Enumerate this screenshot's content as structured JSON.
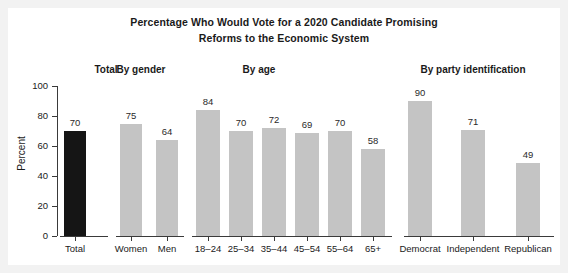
{
  "title": {
    "line1": "Percentage Who Would Vote for a 2020 Candidate Promising",
    "line2": "Reforms to the Economic System"
  },
  "chart_data": {
    "type": "bar",
    "title": "Percentage Who Would Vote for a 2020 Candidate Promising Reforms to the Economic System",
    "xlabel": "",
    "ylabel": "Percent",
    "ylim": [
      0,
      100
    ],
    "yticks": [
      0,
      20,
      40,
      60,
      80,
      100
    ],
    "grid": false,
    "legend": null,
    "groups": [
      {
        "header": "Total",
        "categories": [
          "Total"
        ],
        "values": [
          70
        ],
        "colors": [
          "#151515"
        ]
      },
      {
        "header": "By gender",
        "categories": [
          "Women",
          "Men"
        ],
        "values": [
          75,
          64
        ],
        "colors": [
          "#c4c4c4",
          "#c4c4c4"
        ]
      },
      {
        "header": "By age",
        "categories": [
          "18–24",
          "25–34",
          "35–44",
          "45–54",
          "55–64",
          "65+"
        ],
        "values": [
          84,
          70,
          72,
          69,
          70,
          58
        ],
        "colors": [
          "#c4c4c4",
          "#c4c4c4",
          "#c4c4c4",
          "#c4c4c4",
          "#c4c4c4",
          "#c4c4c4"
        ]
      },
      {
        "header": "By party identification",
        "categories": [
          "Democrat",
          "Independent",
          "Republican"
        ],
        "values": [
          90,
          71,
          49
        ],
        "colors": [
          "#c4c4c4",
          "#c4c4c4",
          "#c4c4c4"
        ]
      }
    ],
    "categories": [
      "Total",
      "Women",
      "Men",
      "18–24",
      "25–34",
      "35–44",
      "45–54",
      "55–64",
      "65+",
      "Democrat",
      "Independent",
      "Republican"
    ],
    "values": [
      70,
      75,
      64,
      84,
      70,
      72,
      69,
      70,
      58,
      90,
      71,
      49
    ]
  },
  "colors": {
    "bar_gray": "#c4c4c4",
    "bar_dark": "#151515",
    "axis": "#3a3a3a",
    "text": "#1a1a1a",
    "panel": "#ffffff",
    "page": "#f2f2f2"
  },
  "yticks": [
    {
      "label": "100",
      "value": 100
    },
    {
      "label": "80",
      "value": 80
    },
    {
      "label": "60",
      "value": 60
    },
    {
      "label": "40",
      "value": 40
    },
    {
      "label": "20",
      "value": 20
    },
    {
      "label": "0",
      "value": 0
    }
  ],
  "layout": {
    "plot_top": 78,
    "plot_bottom": 228,
    "groups": [
      {
        "header_x": 63,
        "header_w": 70,
        "axis_x": 52,
        "axis_w": 48,
        "bars": [
          {
            "x": 56,
            "w": 22
          }
        ]
      },
      {
        "header_x": 88,
        "header_w": 90,
        "axis_x": 108,
        "axis_w": 68,
        "bars": [
          {
            "x": 112,
            "w": 22
          },
          {
            "x": 148,
            "w": 22
          }
        ]
      },
      {
        "header_x": 206,
        "header_w": 90,
        "axis_x": 184,
        "axis_w": 200,
        "bars": [
          {
            "x": 188,
            "w": 24
          },
          {
            "x": 221,
            "w": 24
          },
          {
            "x": 254,
            "w": 24
          },
          {
            "x": 287,
            "w": 24
          },
          {
            "x": 320,
            "w": 24
          },
          {
            "x": 353,
            "w": 24
          }
        ]
      },
      {
        "header_x": 385,
        "header_w": 160,
        "axis_x": 396,
        "axis_w": 150,
        "bars": [
          {
            "x": 400,
            "w": 24
          },
          {
            "x": 453,
            "w": 24
          },
          {
            "x": 508,
            "w": 24
          }
        ]
      }
    ]
  }
}
